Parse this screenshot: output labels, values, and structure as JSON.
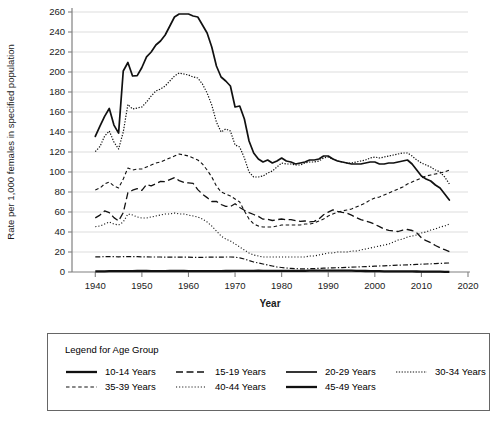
{
  "chart_data": {
    "type": "line",
    "title": "",
    "xlabel": "Year",
    "ylabel": "Rate per 1,000 females in specified population",
    "xlim": [
      1935,
      2020
    ],
    "ylim": [
      0,
      260
    ],
    "xticks": [
      1940,
      1950,
      1960,
      1970,
      1980,
      1990,
      2000,
      2010,
      2020
    ],
    "yticks": [
      0,
      20,
      40,
      60,
      80,
      100,
      120,
      140,
      160,
      180,
      200,
      220,
      240,
      260
    ],
    "grid": "horizontal",
    "legend_position": "below",
    "legend_title": "Legend for Age Group",
    "x": [
      1940,
      1941,
      1942,
      1943,
      1944,
      1945,
      1946,
      1947,
      1948,
      1949,
      1950,
      1951,
      1952,
      1953,
      1954,
      1955,
      1956,
      1957,
      1958,
      1959,
      1960,
      1961,
      1962,
      1963,
      1964,
      1965,
      1966,
      1967,
      1968,
      1969,
      1970,
      1971,
      1972,
      1973,
      1974,
      1975,
      1976,
      1977,
      1978,
      1979,
      1980,
      1981,
      1982,
      1983,
      1984,
      1985,
      1986,
      1987,
      1988,
      1989,
      1990,
      1991,
      1992,
      1993,
      1994,
      1995,
      1996,
      1997,
      1998,
      1999,
      2000,
      2001,
      2002,
      2003,
      2004,
      2005,
      2006,
      2007,
      2008,
      2009,
      2010,
      2011,
      2012,
      2013,
      2014,
      2015,
      2016
    ],
    "series": [
      {
        "name": "10-14 Years",
        "style": "solid-thick",
        "values": [
          0.7,
          0.7,
          0.7,
          0.8,
          0.8,
          0.8,
          0.9,
          0.9,
          0.9,
          1.0,
          1.0,
          1.0,
          0.9,
          0.9,
          0.9,
          0.9,
          1.0,
          1.0,
          1.0,
          1.0,
          0.8,
          0.9,
          0.8,
          0.9,
          0.9,
          0.8,
          0.9,
          0.9,
          1.0,
          1.0,
          1.2,
          1.1,
          1.2,
          1.2,
          1.2,
          1.3,
          1.2,
          1.2,
          1.2,
          1.2,
          1.1,
          1.1,
          1.1,
          1.1,
          1.2,
          1.2,
          1.3,
          1.3,
          1.3,
          1.4,
          1.4,
          1.4,
          1.4,
          1.4,
          1.4,
          1.3,
          1.2,
          1.1,
          1.0,
          0.9,
          0.9,
          0.8,
          0.7,
          0.6,
          0.7,
          0.7,
          0.6,
          0.6,
          0.6,
          0.5,
          0.4,
          0.4,
          0.4,
          0.3,
          0.3,
          0.2,
          0.2
        ]
      },
      {
        "name": "15-19 Years",
        "style": "dashed-long",
        "values": [
          54.1,
          56.9,
          61.1,
          59.3,
          54.4,
          51.1,
          59.3,
          79.3,
          81.8,
          83.4,
          81.6,
          87.6,
          86.1,
          88.2,
          90.6,
          90.3,
          92.3,
          94.3,
          91.4,
          89.7,
          89.1,
          88.6,
          82.4,
          77.8,
          74.4,
          70.5,
          70.6,
          67.5,
          65.6,
          65.5,
          68.3,
          64.5,
          61.7,
          59.3,
          57.5,
          55.6,
          52.8,
          52.8,
          51.5,
          52.3,
          53.0,
          52.2,
          52.4,
          51.4,
          50.6,
          51.0,
          50.2,
          50.6,
          53.0,
          57.3,
          59.9,
          62.1,
          60.7,
          59.6,
          58.9,
          56.8,
          54.4,
          52.3,
          51.1,
          49.6,
          47.7,
          45.3,
          43.0,
          41.6,
          41.1,
          40.5,
          41.9,
          42.5,
          41.5,
          39.1,
          34.2,
          31.3,
          29.4,
          26.5,
          24.2,
          22.3,
          20.3
        ]
      },
      {
        "name": "20-29 Years",
        "style": "solid",
        "values": [
          135.6,
          145.8,
          155.6,
          163.5,
          146.9,
          138.9,
          201.0,
          209.5,
          196.0,
          196.3,
          204.5,
          215.2,
          220.0,
          227.0,
          231.0,
          237.0,
          246.0,
          255.0,
          258.0,
          258.0,
          258.0,
          256.0,
          255.0,
          247.0,
          239.0,
          225.0,
          206.0,
          195.0,
          191.0,
          186.0,
          165.0,
          166.0,
          153.0,
          131.0,
          119.0,
          113.0,
          110.0,
          112.0,
          109.0,
          111.0,
          114.0,
          111.0,
          110.0,
          108.0,
          109.0,
          110.0,
          112.0,
          112.0,
          113.0,
          116.0,
          116.0,
          113.0,
          111.0,
          110.0,
          109.0,
          108.0,
          108.0,
          108.0,
          109.0,
          110.0,
          110.0,
          108.0,
          108.0,
          109.0,
          109.0,
          110.0,
          111.0,
          112.0,
          108.0,
          102.0,
          96.0,
          93.0,
          91.0,
          87.0,
          84.0,
          78.0,
          72.0
        ]
      },
      {
        "name": "30-34 Years",
        "style": "dotted-fine",
        "values": [
          120.4,
          125.5,
          135.8,
          141.0,
          130.0,
          123.0,
          140.0,
          167.5,
          163.0,
          164.0,
          165.0,
          170.0,
          176.0,
          181.0,
          183.0,
          186.0,
          191.0,
          196.0,
          199.0,
          198.0,
          197.0,
          195.0,
          194.0,
          188.0,
          179.0,
          167.0,
          150.0,
          140.0,
          143.0,
          141.0,
          127.0,
          125.0,
          114.0,
          100.0,
          95.0,
          95.0,
          96.0,
          99.0,
          101.0,
          105.0,
          109.0,
          108.0,
          108.0,
          107.0,
          107.0,
          109.0,
          110.0,
          110.0,
          111.0,
          114.0,
          115.0,
          113.0,
          111.0,
          110.0,
          109.0,
          109.0,
          110.0,
          111.0,
          112.0,
          114.0,
          115.0,
          114.0,
          115.0,
          116.0,
          117.0,
          118.0,
          119.0,
          119.0,
          116.0,
          112.0,
          109.0,
          107.0,
          105.0,
          102.0,
          100.0,
          95.0,
          88.0
        ]
      },
      {
        "name": "35-39 Years",
        "style": "dashed-short",
        "values": [
          82.1,
          84.0,
          88.0,
          90.0,
          86.0,
          84.0,
          93.0,
          104.0,
          102.0,
          103.0,
          103.0,
          105.0,
          107.0,
          109.0,
          110.0,
          112.0,
          114.0,
          116.0,
          118.0,
          117.0,
          116.0,
          114.0,
          112.0,
          108.0,
          102.0,
          95.0,
          86.0,
          80.0,
          78.0,
          76.0,
          73.0,
          70.0,
          61.0,
          53.0,
          48.0,
          46.0,
          45.0,
          45.0,
          45.0,
          46.0,
          47.0,
          47.0,
          47.0,
          47.0,
          47.0,
          48.0,
          48.0,
          49.0,
          51.0,
          53.0,
          56.0,
          58.0,
          60.0,
          61.0,
          62.0,
          63.0,
          65.0,
          67.0,
          69.0,
          72.0,
          74.0,
          75.0,
          77.0,
          79.0,
          81.0,
          83.0,
          85.0,
          88.0,
          90.0,
          92.0,
          94.0,
          96.0,
          97.0,
          98.0,
          99.0,
          100.0,
          102.0
        ]
      },
      {
        "name": "40-44 Years",
        "style": "dotted-med",
        "values": [
          45.3,
          46.0,
          48.0,
          50.0,
          48.0,
          47.0,
          50.0,
          58.0,
          57.0,
          55.0,
          54.0,
          54.0,
          55.0,
          56.0,
          57.0,
          58.0,
          58.0,
          59.0,
          58.0,
          58.0,
          57.0,
          56.0,
          55.0,
          53.0,
          50.0,
          46.0,
          41.0,
          36.0,
          33.0,
          31.0,
          28.0,
          25.0,
          22.0,
          19.0,
          17.0,
          16.0,
          15.0,
          15.0,
          15.0,
          15.0,
          15.0,
          15.0,
          15.0,
          15.0,
          15.0,
          15.0,
          16.0,
          16.0,
          17.0,
          18.0,
          19.0,
          19.0,
          20.0,
          20.0,
          20.0,
          21.0,
          21.0,
          22.0,
          23.0,
          24.0,
          25.0,
          26.0,
          27.0,
          28.0,
          30.0,
          32.0,
          33.0,
          35.0,
          36.0,
          37.0,
          39.0,
          40.0,
          42.0,
          43.0,
          45.0,
          46.0,
          48.0
        ]
      },
      {
        "name": "45-49 Years",
        "style": "dash-dot",
        "values": [
          15.2,
          15.2,
          15.3,
          15.4,
          15.3,
          15.2,
          15.3,
          15.4,
          15.4,
          15.3,
          15.2,
          15.1,
          15.0,
          15.0,
          15.0,
          14.9,
          14.9,
          14.9,
          14.8,
          14.8,
          14.8,
          14.7,
          14.7,
          14.7,
          14.8,
          14.8,
          14.9,
          14.9,
          15.0,
          15.0,
          14.8,
          14.2,
          13.0,
          11.5,
          10.0,
          9.0,
          8.0,
          7.0,
          6.0,
          5.0,
          4.5,
          4.0,
          3.6,
          3.3,
          3.2,
          3.2,
          3.3,
          3.4,
          3.6,
          3.8,
          4.0,
          4.2,
          4.3,
          4.4,
          4.6,
          4.8,
          5.0,
          5.2,
          5.4,
          5.6,
          5.8,
          6.0,
          6.2,
          6.4,
          6.6,
          6.8,
          7.0,
          7.2,
          7.4,
          7.6,
          7.8,
          8.0,
          8.2,
          8.4,
          8.6,
          8.8,
          9.0
        ]
      }
    ]
  },
  "legend": {
    "title": "Legend for Age Group",
    "row1": [
      {
        "label": "10-14 Years",
        "style": "solid-thick"
      },
      {
        "label": "15-19 Years",
        "style": "dashed-long"
      },
      {
        "label": "20-29 Years",
        "style": "solid"
      },
      {
        "label": "30-34 Years",
        "style": "dotted-fine"
      }
    ],
    "row2": [
      {
        "label": "35-39 Years",
        "style": "dashed-short"
      },
      {
        "label": "40-44 Years",
        "style": "dotted-med"
      },
      {
        "label": "45-49 Years",
        "style": "solid-thick"
      }
    ]
  },
  "colors": {
    "line": "#111111",
    "grid": "#d9d9d9",
    "axis": "#808080",
    "text": "#1a1a1a",
    "legend_border": "#666666"
  }
}
